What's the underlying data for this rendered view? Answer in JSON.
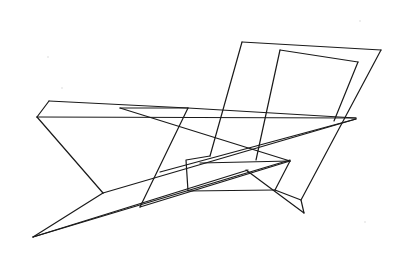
{
  "figure": {
    "type": "line-drawing",
    "stroke_color": "#1a1a1a",
    "background_color": "#ffffff",
    "width": 403,
    "height": 254
  },
  "segments": [
    {
      "name": "slab-top-edge",
      "points": [
        [
          49,
          101
        ],
        [
          188,
          108
        ],
        [
          356,
          118
        ]
      ]
    },
    {
      "name": "slab-left-upper",
      "points": [
        [
          49,
          101
        ],
        [
          37,
          117
        ]
      ]
    },
    {
      "name": "slab-baseline",
      "points": [
        [
          37,
          117
        ],
        [
          356,
          118
        ]
      ]
    },
    {
      "name": "slab-left-down",
      "points": [
        [
          37,
          117
        ],
        [
          103,
          193
        ]
      ]
    },
    {
      "name": "slab-right-diag",
      "points": [
        [
          188,
          108
        ],
        [
          140,
          207
        ]
      ]
    },
    {
      "name": "small-triangle-top",
      "points": [
        [
          120,
          108
        ],
        [
          188,
          108
        ]
      ]
    },
    {
      "name": "small-triangle-diag",
      "points": [
        [
          120,
          108
        ],
        [
          290,
          161
        ]
      ]
    },
    {
      "name": "lower-triangle-bottom",
      "points": [
        [
          140,
          207
        ],
        [
          290,
          161
        ]
      ]
    },
    {
      "name": "spike-upper",
      "points": [
        [
          103,
          193
        ],
        [
          33,
          237
        ]
      ]
    },
    {
      "name": "spike-lower",
      "points": [
        [
          33,
          237
        ],
        [
          290,
          160
        ]
      ]
    },
    {
      "name": "spike-top-edge",
      "points": [
        [
          103,
          193
        ],
        [
          356,
          119
        ]
      ]
    },
    {
      "name": "spike-lower-2",
      "points": [
        [
          33,
          237
        ],
        [
          248,
          170
        ]
      ]
    },
    {
      "name": "back-panel-left",
      "points": [
        [
          242,
          42
        ],
        [
          210,
          156
        ]
      ]
    },
    {
      "name": "back-panel-top",
      "points": [
        [
          242,
          42
        ],
        [
          381,
          50
        ]
      ]
    },
    {
      "name": "back-panel-right",
      "points": [
        [
          381,
          50
        ],
        [
          301,
          200
        ]
      ]
    },
    {
      "name": "inner-panel-top",
      "points": [
        [
          280,
          50
        ],
        [
          358,
          62
        ]
      ]
    },
    {
      "name": "inner-panel-right",
      "points": [
        [
          358,
          62
        ],
        [
          334,
          121
        ]
      ]
    },
    {
      "name": "inner-panel-left",
      "points": [
        [
          280,
          50
        ],
        [
          256,
          160
        ]
      ]
    },
    {
      "name": "base-left",
      "points": [
        [
          210,
          156
        ],
        [
          186,
          160
        ],
        [
          188,
          191
        ],
        [
          275,
          190
        ]
      ]
    },
    {
      "name": "base-right",
      "points": [
        [
          275,
          190
        ],
        [
          301,
          200
        ],
        [
          304,
          213
        ]
      ]
    },
    {
      "name": "leg-diag",
      "points": [
        [
          246,
          170
        ],
        [
          304,
          213
        ]
      ]
    },
    {
      "name": "base-right-up",
      "points": [
        [
          275,
          190
        ],
        [
          290,
          161
        ]
      ]
    },
    {
      "name": "mid-line-1",
      "points": [
        [
          160,
          172
        ],
        [
          356,
          119
        ]
      ]
    },
    {
      "name": "mid-line-2",
      "points": [
        [
          200,
          163
        ],
        [
          290,
          161
        ]
      ]
    }
  ],
  "specks": [
    [
      360,
      21
    ],
    [
      48,
      57
    ],
    [
      62,
      88
    ],
    [
      365,
      222
    ]
  ]
}
